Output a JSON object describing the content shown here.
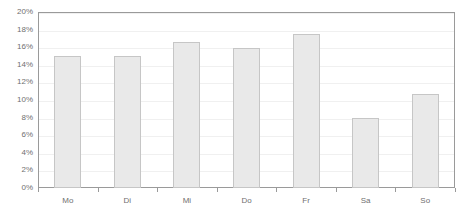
{
  "chart_data": {
    "type": "bar",
    "title": "",
    "subtitle": "",
    "xlabel": "",
    "ylabel": "",
    "categories": [
      "Mo",
      "Di",
      "Mi",
      "Do",
      "Fr",
      "Sa",
      "So"
    ],
    "values": [
      15.0,
      15.0,
      16.6,
      15.9,
      17.5,
      7.9,
      10.7
    ],
    "value_format": "percent",
    "ylim": [
      0,
      20
    ],
    "ytick_values": [
      0,
      2,
      4,
      6,
      8,
      10,
      12,
      14,
      16,
      18,
      20
    ],
    "ytick_labels": [
      "0%",
      "2%",
      "4%",
      "6%",
      "8%",
      "10%",
      "12%",
      "14%",
      "16%",
      "18%",
      "20%"
    ],
    "grid": true,
    "grid_axis": "y",
    "legend": false,
    "legend_position": "none",
    "series": [
      {
        "name": "",
        "values": [
          15.0,
          15.0,
          16.6,
          15.9,
          17.5,
          7.9,
          10.7
        ]
      }
    ],
    "colors": {
      "bar_fill": "#e9e9e9",
      "bar_border": "#c6c6c6",
      "frame": "#9a9a9a",
      "gridline": "#f0f0f0",
      "tick_label": "#6f6f6f",
      "background": "#ffffff"
    }
  }
}
